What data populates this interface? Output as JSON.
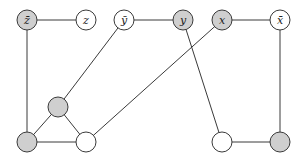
{
  "diagram": {
    "colors": {
      "edge": "#3a3a3a",
      "node_stroke": "#3a3a3a",
      "filled": "#cfcfcf",
      "empty": "#ffffff"
    },
    "node_radius": 10,
    "nodes": [
      {
        "id": "zbar",
        "label": "z̄",
        "x": 27,
        "y": 20,
        "filled": true
      },
      {
        "id": "z",
        "label": "z",
        "x": 86,
        "y": 20,
        "filled": false
      },
      {
        "id": "ybar",
        "label": "ȳ",
        "x": 124,
        "y": 20,
        "filled": false
      },
      {
        "id": "y",
        "label": "y",
        "x": 183,
        "y": 20,
        "filled": true
      },
      {
        "id": "x",
        "label": "x",
        "x": 222,
        "y": 20,
        "filled": true
      },
      {
        "id": "xbar",
        "label": "x̄",
        "x": 280,
        "y": 20,
        "filled": false
      },
      {
        "id": "tri_top",
        "label": "",
        "x": 58,
        "y": 107,
        "filled": true
      },
      {
        "id": "bottom_left",
        "label": "",
        "x": 27,
        "y": 142,
        "filled": true
      },
      {
        "id": "bottom_mid",
        "label": "",
        "x": 86,
        "y": 142,
        "filled": false
      },
      {
        "id": "bottom_right_white",
        "label": "",
        "x": 222,
        "y": 142,
        "filled": false
      },
      {
        "id": "bottom_right_gray",
        "label": "",
        "x": 280,
        "y": 142,
        "filled": true
      }
    ],
    "edges": [
      [
        "zbar",
        "z"
      ],
      [
        "ybar",
        "y"
      ],
      [
        "x",
        "xbar"
      ],
      [
        "zbar",
        "bottom_left"
      ],
      [
        "ybar",
        "tri_top"
      ],
      [
        "tri_top",
        "bottom_left"
      ],
      [
        "tri_top",
        "bottom_mid"
      ],
      [
        "bottom_left",
        "bottom_mid"
      ],
      [
        "bottom_mid",
        "x"
      ],
      [
        "y",
        "bottom_right_white"
      ],
      [
        "bottom_right_white",
        "bottom_right_gray"
      ],
      [
        "xbar",
        "bottom_right_gray"
      ]
    ]
  }
}
